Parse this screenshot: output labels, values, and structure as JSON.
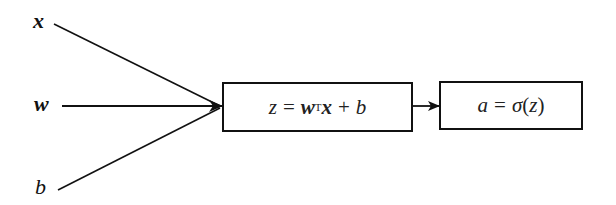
{
  "diagram": {
    "title": "",
    "type": "logistic-regression-computation-graph",
    "inputs": [
      {
        "id": "x",
        "label": "x",
        "style": "bold-italic"
      },
      {
        "id": "w",
        "label": "w",
        "style": "bold-italic"
      },
      {
        "id": "b",
        "label": "b",
        "style": "italic"
      }
    ],
    "nodes": [
      {
        "id": "linear",
        "parts": {
          "lhs": "z",
          "eq": "=",
          "w": "w",
          "transpose": "T",
          "x": "x",
          "plus": "+",
          "b": "b"
        },
        "text": "z = wᵀx + b"
      },
      {
        "id": "activation",
        "parts": {
          "lhs": "a",
          "eq": "=",
          "sigma": "σ",
          "open": "(",
          "arg": "z",
          "close": ")"
        },
        "text": "a = σ(z)"
      }
    ],
    "edges": [
      {
        "from": "x",
        "to": "linear"
      },
      {
        "from": "w",
        "to": "linear"
      },
      {
        "from": "b",
        "to": "linear"
      },
      {
        "from": "linear",
        "to": "activation"
      }
    ],
    "colors": {
      "stroke": "#111111",
      "background": "#ffffff",
      "text": "#222222"
    }
  }
}
